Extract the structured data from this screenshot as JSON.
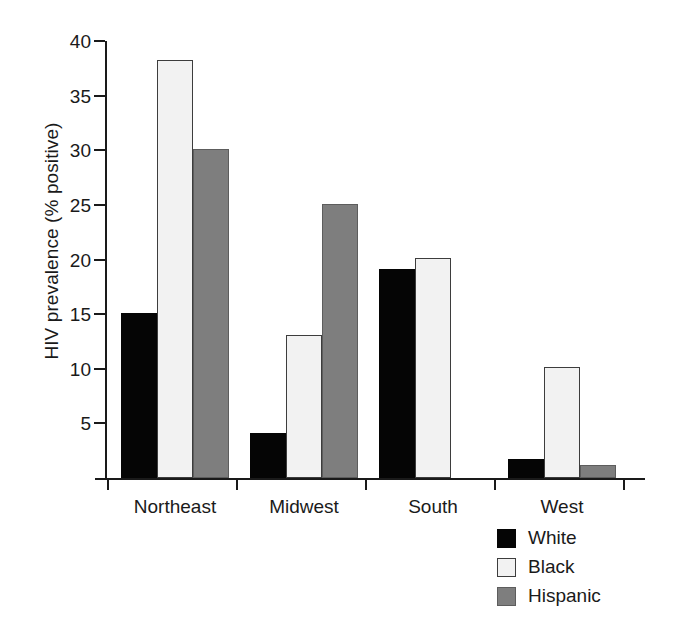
{
  "chart_data": {
    "type": "bar",
    "title": "",
    "subtitle": "",
    "xlabel": "",
    "ylabel": "HIV prevalence (% positive)",
    "categories": [
      "Northeast",
      "Midwest",
      "South",
      "West"
    ],
    "series": [
      {
        "name": "White",
        "color": "#050505",
        "values": [
          15.1,
          4.1,
          19.1,
          1.7
        ]
      },
      {
        "name": "Black",
        "color": "#f2f2f2",
        "values": [
          38.3,
          13.1,
          20.1,
          10.2
        ]
      },
      {
        "name": "Hispanic",
        "color": "#7e7e7e",
        "values": [
          30.1,
          25.1,
          null,
          1.2
        ]
      }
    ],
    "ylim": [
      0,
      40
    ],
    "yticks": [
      5,
      10,
      15,
      20,
      25,
      30,
      35,
      40
    ],
    "ytick_labels": [
      "5",
      "10",
      "15",
      "20",
      "25",
      "30",
      "35",
      "40"
    ],
    "grid": false,
    "legend_position": "bottom-right"
  },
  "legend": {
    "items": [
      {
        "label": "White"
      },
      {
        "label": "Black"
      },
      {
        "label": "Hispanic"
      }
    ]
  },
  "axes": {
    "y_title": "HIV prevalence (% positive)"
  }
}
